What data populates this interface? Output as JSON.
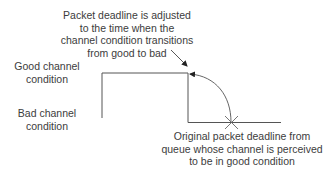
{
  "annotations": {
    "top": {
      "lines": [
        "Packet deadline is adjusted",
        "to the time when the",
        "channel condition transitions",
        "from good to bad"
      ]
    },
    "bottom": {
      "lines": [
        "Original packet deadline from",
        "queue whose channel is perceived",
        "to be in good condition"
      ]
    }
  },
  "axis_labels": {
    "good": {
      "lines": [
        "Good channel",
        "condition"
      ]
    },
    "bad": {
      "lines": [
        "Bad channel",
        "condition"
      ]
    }
  },
  "colors": {
    "line": "#555555",
    "text": "#3c3c3c",
    "background": "#ffffff"
  }
}
